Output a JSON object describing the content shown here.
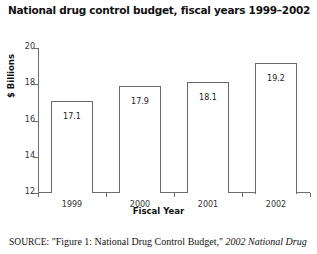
{
  "figure": {
    "title": "National drug control budget, fiscal years 1999–2002",
    "source_label": "SOURCE:",
    "source_text": " \"Figure 1: National Drug Control Budget,\" ",
    "source_italic": "2002 National Drug"
  },
  "chart_data": {
    "type": "bar",
    "title": "National drug control budget, fiscal years 1999–2002",
    "xlabel": "Fiscal Year",
    "ylabel": "$ Billions",
    "categories": [
      "1999",
      "2000",
      "2001",
      "2002"
    ],
    "values": [
      17.1,
      17.9,
      18.1,
      19.2
    ],
    "value_labels": [
      "17.1",
      "17.9",
      "18.1",
      "19.2"
    ],
    "ylim": [
      12,
      20
    ],
    "yticks": [
      12,
      14,
      16,
      18,
      20
    ],
    "ytick_labels": [
      "12",
      "14",
      "16",
      "18",
      "20"
    ],
    "grid": false,
    "legend": false,
    "bar_fill": "#ffffff",
    "bar_edge": "#6a6a6a",
    "axis_color": "#6d6d6d",
    "series": [
      {
        "name": "National drug control budget",
        "values": [
          17.1,
          17.9,
          18.1,
          19.2
        ]
      }
    ]
  }
}
